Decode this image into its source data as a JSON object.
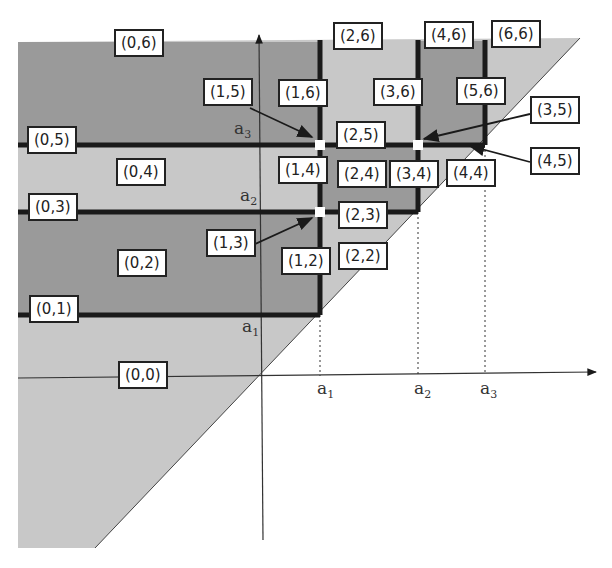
{
  "diagram": {
    "type": "region partition of half-plane above diagonal",
    "colors": {
      "background": "#ffffff",
      "light_region": "#c8c8c8",
      "dark_region": "#9a9a9a",
      "lines": "#1a1a1a"
    },
    "axis_labels": {
      "x_ticks": [
        "a1",
        "a2",
        "a3"
      ],
      "y_ticks": [
        "a1",
        "a2",
        "a3"
      ]
    },
    "region_labels": [
      "(0,0)",
      "(0,1)",
      "(0,2)",
      "(0,3)",
      "(0,4)",
      "(0,5)",
      "(0,6)",
      "(1,2)",
      "(1,3)",
      "(1,4)",
      "(1,5)",
      "(1,6)",
      "(2,2)",
      "(2,3)",
      "(2,4)",
      "(2,5)",
      "(2,6)",
      "(3,4)",
      "(3,5)",
      "(3,6)",
      "(4,4)",
      "(4,5)",
      "(4,6)",
      "(5,6)",
      "(6,6)"
    ]
  },
  "labels": {
    "l00": "(0,0)",
    "l01": "(0,1)",
    "l02": "(0,2)",
    "l03": "(0,3)",
    "l04": "(0,4)",
    "l05": "(0,5)",
    "l06": "(0,6)",
    "l12": "(1,2)",
    "l13": "(1,3)",
    "l14": "(1,4)",
    "l15": "(1,5)",
    "l16": "(1,6)",
    "l22": "(2,2)",
    "l23": "(2,3)",
    "l24": "(2,4)",
    "l25": "(2,5)",
    "l26": "(2,6)",
    "l34": "(3,4)",
    "l35": "(3,5)",
    "l36": "(3,6)",
    "l44": "(4,4)",
    "l45": "(4,5)",
    "l46": "(4,6)",
    "l56": "(5,6)",
    "l66": "(6,6)"
  },
  "axes": {
    "x_a1": "a",
    "x_a2": "a",
    "x_a3": "a",
    "y_a1": "a",
    "y_a2": "a",
    "y_a3": "a",
    "sub1": "1",
    "sub2": "2",
    "sub3": "3"
  }
}
